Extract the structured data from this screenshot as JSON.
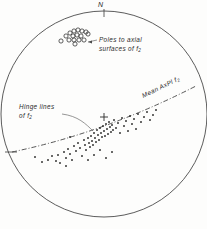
{
  "figure": {
    "type": "stereographic-projection",
    "projection": "equal-area lower hemisphere stereonet",
    "orientation_label": "N",
    "center_mark": "+"
  },
  "labels": {
    "north": "N",
    "poles_line1": "Poles  to  axial",
    "poles_line2": "surfaces  of  f",
    "poles_sub": "2",
    "hinge_line1": "Hinge  lines",
    "hinge_line2": "of  f",
    "hinge_sub": "2",
    "mean_axpl": "Mean  AxPl  f",
    "mean_sub": "2"
  },
  "colors": {
    "ink": "#2b2b2b",
    "circle": "#4a4a4a",
    "paper": "#fdfdfc",
    "leader": "#6a6a6a"
  },
  "chart_data": {
    "type": "scatter",
    "title": "",
    "xlabel": "",
    "ylabel": "",
    "coordinate_system": "stereonet, unit radius, N at top",
    "primitive_circle": {
      "cx": 104,
      "cy": 114,
      "r": 103
    },
    "center_cross": {
      "x": 104,
      "y": 117
    },
    "edge_ticks": [
      {
        "x": 104,
        "y": 11,
        "label": "N",
        "angle": 0
      },
      {
        "x": 11,
        "y": 152,
        "label": "",
        "angle": 270
      }
    ],
    "series": [
      {
        "name": "Poles to axial surfaces of f2",
        "marker": "open-circle",
        "count": 16,
        "points": [
          [
            66,
            36
          ],
          [
            70,
            33
          ],
          [
            74,
            31
          ],
          [
            78,
            30
          ],
          [
            82,
            31
          ],
          [
            73,
            36
          ],
          [
            77,
            35
          ],
          [
            81,
            36
          ],
          [
            86,
            32
          ],
          [
            88,
            34
          ],
          [
            69,
            40
          ],
          [
            74,
            40
          ],
          [
            79,
            40
          ],
          [
            84,
            40
          ],
          [
            61,
            41
          ],
          [
            75,
            44
          ]
        ]
      },
      {
        "name": "Hinge lines of f2",
        "marker": "dot",
        "count": 72,
        "points": [
          [
            35,
            157
          ],
          [
            42,
            162
          ],
          [
            48,
            160
          ],
          [
            52,
            156
          ],
          [
            56,
            161
          ],
          [
            58,
            155
          ],
          [
            60,
            163
          ],
          [
            64,
            152
          ],
          [
            66,
            158
          ],
          [
            68,
            149
          ],
          [
            70,
            154
          ],
          [
            72,
            160
          ],
          [
            74,
            146
          ],
          [
            76,
            151
          ],
          [
            78,
            143
          ],
          [
            80,
            148
          ],
          [
            82,
            156
          ],
          [
            84,
            140
          ],
          [
            85,
            145
          ],
          [
            86,
            150
          ],
          [
            88,
            138
          ],
          [
            89,
            143
          ],
          [
            90,
            147
          ],
          [
            91,
            136
          ],
          [
            92,
            141
          ],
          [
            93,
            145
          ],
          [
            94,
            133
          ],
          [
            95,
            138
          ],
          [
            96,
            142
          ],
          [
            97,
            130
          ],
          [
            98,
            135
          ],
          [
            99,
            140
          ],
          [
            100,
            128
          ],
          [
            101,
            133
          ],
          [
            102,
            137
          ],
          [
            103,
            126
          ],
          [
            104,
            131
          ],
          [
            105,
            136
          ],
          [
            106,
            124
          ],
          [
            107,
            129
          ],
          [
            108,
            134
          ],
          [
            109,
            122
          ],
          [
            110,
            127
          ],
          [
            111,
            132
          ],
          [
            112,
            125
          ],
          [
            113,
            130
          ],
          [
            114,
            120
          ],
          [
            116,
            128
          ],
          [
            118,
            123
          ],
          [
            120,
            133
          ],
          [
            122,
            118
          ],
          [
            124,
            126
          ],
          [
            126,
            121
          ],
          [
            128,
            131
          ],
          [
            130,
            116
          ],
          [
            132,
            124
          ],
          [
            134,
            119
          ],
          [
            136,
            129
          ],
          [
            138,
            114
          ],
          [
            141,
            122
          ],
          [
            144,
            117
          ],
          [
            147,
            112
          ],
          [
            150,
            120
          ],
          [
            153,
            115
          ],
          [
            156,
            110
          ],
          [
            70,
            137
          ],
          [
            88,
            160
          ],
          [
            94,
            155
          ],
          [
            100,
            150
          ],
          [
            106,
            158
          ],
          [
            112,
            152
          ],
          [
            66,
            166
          ]
        ]
      }
    ],
    "girdle": {
      "name": "Mean AxPl f2",
      "style": "dash-dot",
      "from": [
        12,
        152
      ],
      "to": [
        196,
        86
      ],
      "sag": 14
    },
    "legend_position": "inline-annotations",
    "grid": false
  }
}
